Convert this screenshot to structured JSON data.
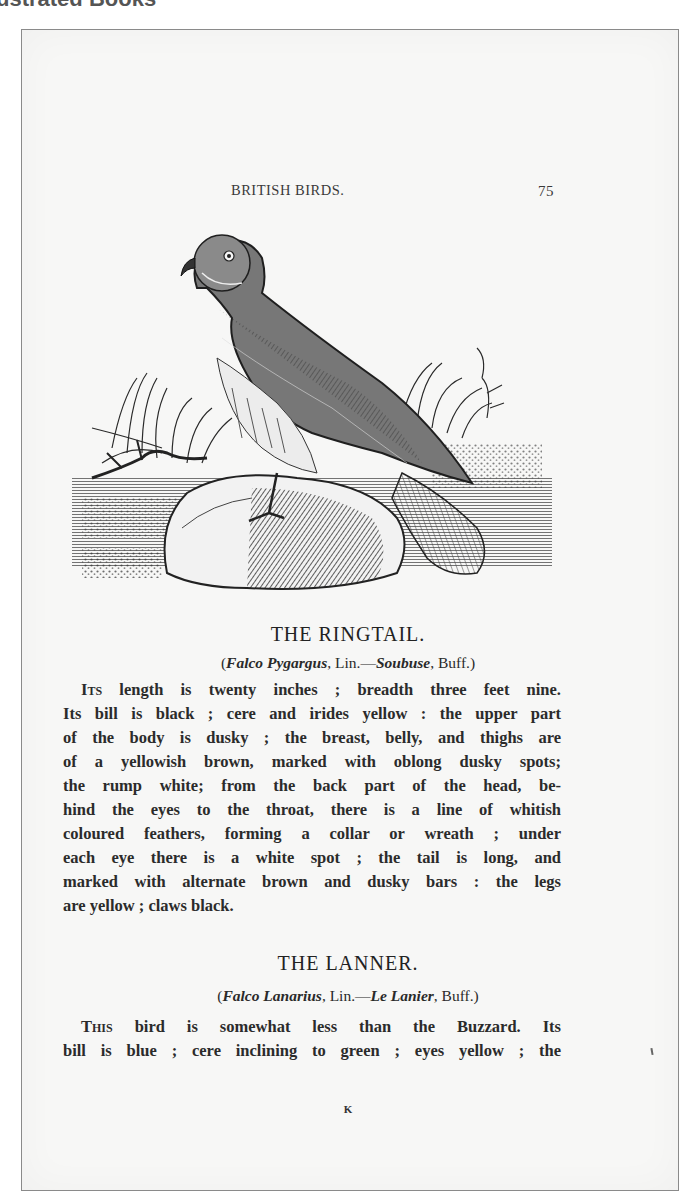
{
  "header": {
    "caption": "ustrated Books"
  },
  "page": {
    "running_title": "BRITISH BIRDS.",
    "page_number": "75",
    "illustration": {
      "subject": "Ringtail hawk perched on a rock among grasses (wood engraving)"
    },
    "sections": [
      {
        "heading": "THE RINGTAIL.",
        "synonym": {
          "open": "(",
          "latin": "Falco Pygargus",
          "sep1": ", Lin.—",
          "french": "Soubuse",
          "sep2": ", Buff.)"
        },
        "lines": [
          {
            "lead": "Its",
            "text": " length is twenty inches ; breadth three feet nine."
          },
          {
            "text": "Its bill is black ; cere and irides yellow : the upper part"
          },
          {
            "text": "of the body is dusky ; the breast, belly, and thighs are"
          },
          {
            "text": "of a yellowish brown, marked with oblong dusky spots;"
          },
          {
            "text": "the rump white; from the back part of the head, be-"
          },
          {
            "text": "hind the eyes to the throat, there is a line of whitish"
          },
          {
            "text": "coloured feathers, forming a collar or wreath ; under"
          },
          {
            "text": "each eye there is a white spot ; the tail is long, and"
          },
          {
            "text": "marked with alternate brown and dusky bars : the legs"
          },
          {
            "text": "are yellow ; claws black."
          }
        ]
      },
      {
        "heading": "THE LANNER.",
        "synonym": {
          "open": "(",
          "latin": "Falco Lanarius",
          "sep1": ", Lin.—",
          "french": "Le Lanier",
          "sep2": ", Buff.)"
        },
        "lines": [
          {
            "lead": "This",
            "text": " bird is somewhat less than the Buzzard.  Its"
          },
          {
            "text": "bill is blue ; cere inclining to green ; eyes yellow ; the"
          }
        ]
      }
    ],
    "signature_mark": "K"
  }
}
